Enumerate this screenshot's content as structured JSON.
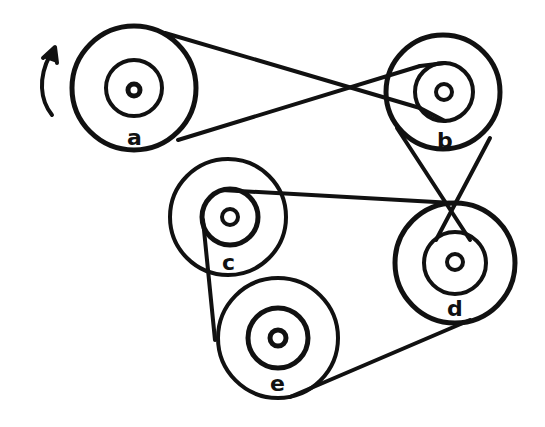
{
  "diagram": {
    "stroke_color": "#111111",
    "background": "#ffffff",
    "rotation_arrow": {
      "direction": "counterclockwise-up",
      "near": "a"
    },
    "pulleys": [
      {
        "id": "a",
        "label": "a",
        "cx": 134,
        "cy": 88,
        "outer_r": 62,
        "inner_r": 28,
        "hub_r": 7
      },
      {
        "id": "b",
        "label": "b",
        "cx": 443,
        "cy": 92,
        "outer_r": 57,
        "inner_r": 30,
        "hub_r": 8
      },
      {
        "id": "c",
        "label": "c",
        "cx": 228,
        "cy": 213,
        "outer_r": 58,
        "inner_r": 28,
        "hub_r": 8
      },
      {
        "id": "d",
        "label": "d",
        "cx": 455,
        "cy": 262,
        "outer_r": 60,
        "inner_r": 32,
        "hub_r": 8
      },
      {
        "id": "e",
        "label": "e",
        "cx": 278,
        "cy": 338,
        "outer_r": 60,
        "inner_r": 30,
        "hub_r": 8
      }
    ],
    "belts": [
      {
        "from": "a-outer",
        "to": "b-inner",
        "type": "crossed"
      },
      {
        "from": "b-outer",
        "to": "d-inner",
        "type": "crossed"
      },
      {
        "from": "c-inner",
        "to": "d-outer",
        "via": "e-outer",
        "type": "open"
      }
    ]
  }
}
